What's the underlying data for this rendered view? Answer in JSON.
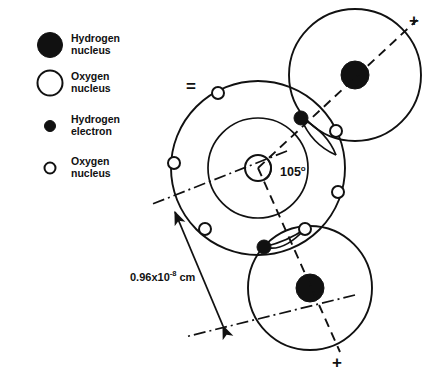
{
  "figure": {
    "width": 438,
    "height": 374,
    "background": "#ffffff",
    "ink_color": "#111111"
  },
  "legend": {
    "items": [
      {
        "symbol": "large-filled-circle",
        "label_line1": "Hydrogen",
        "label_line2": "nucleus"
      },
      {
        "symbol": "large-open-circle",
        "label_line1": "Oxygen",
        "label_line2": "nucleus"
      },
      {
        "symbol": "small-filled-circle",
        "label_line1": "Hydrogen",
        "label_line2": "electron"
      },
      {
        "symbol": "small-open-circle",
        "label_line1": "Oxygen",
        "label_line2": "nucleus"
      }
    ]
  },
  "annotations": {
    "bond_angle": "105",
    "bond_angle_degree_sign": "o",
    "bond_length_mantissa": "0.96x10",
    "bond_length_exponent": "-8",
    "bond_length_unit": "cm",
    "equals_sign": "=",
    "charge_top": "+",
    "charge_bottom": "+"
  }
}
